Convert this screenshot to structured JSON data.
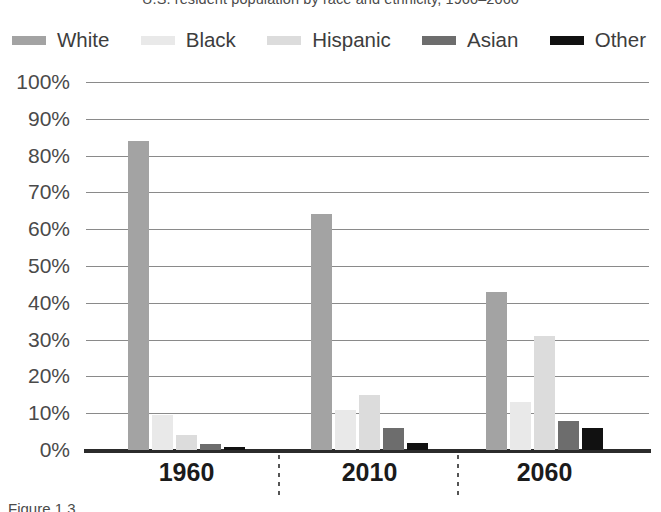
{
  "title": "U.S. resident population by race and ethnicity, 1960–2060",
  "caption": "Figure 1.3",
  "legend": {
    "position": "top",
    "items": [
      {
        "label": "White",
        "color": "#a3a3a3"
      },
      {
        "label": "Black",
        "color": "#e9e9e9"
      },
      {
        "label": "Hispanic",
        "color": "#dcdcdc"
      },
      {
        "label": "Asian",
        "color": "#6d6d6d"
      },
      {
        "label": "Other",
        "color": "#111111"
      }
    ]
  },
  "axis": {
    "y_ticks": [
      "100%",
      "90%",
      "80%",
      "70%",
      "60%",
      "50%",
      "40%",
      "30%",
      "20%",
      "10%",
      "0%"
    ],
    "x_ticks": [
      "1960",
      "2010",
      "2060"
    ]
  },
  "chart_data": {
    "type": "bar",
    "title": "U.S. resident population by race and ethnicity, 1960–2060",
    "xlabel": "",
    "ylabel": "",
    "ylim": [
      0,
      100
    ],
    "ytick_step": 10,
    "grid": true,
    "legend_position": "top",
    "categories": [
      "1960",
      "2010",
      "2060"
    ],
    "series": [
      {
        "name": "White",
        "color": "#a3a3a3",
        "values": [
          84,
          64,
          43
        ]
      },
      {
        "name": "Black",
        "color": "#e9e9e9",
        "values": [
          9.5,
          11,
          13
        ]
      },
      {
        "name": "Hispanic",
        "color": "#dcdcdc",
        "values": [
          4,
          15,
          31
        ]
      },
      {
        "name": "Asian",
        "color": "#6d6d6d",
        "values": [
          1.5,
          6,
          8
        ]
      },
      {
        "name": "Other",
        "color": "#111111",
        "values": [
          0.8,
          2,
          6
        ]
      }
    ]
  }
}
